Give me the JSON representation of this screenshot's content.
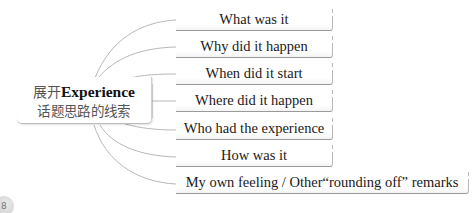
{
  "diagram": {
    "type": "mind-map",
    "center": {
      "line1_cn": "展开",
      "line1_en": "Experience",
      "line2": "话题思路的线索"
    },
    "branches": [
      {
        "label": "What was it"
      },
      {
        "label": "Why did it happen"
      },
      {
        "label": "When did it start"
      },
      {
        "label": "Where did it happen"
      },
      {
        "label": "Who had the experience"
      },
      {
        "label": "How was it"
      },
      {
        "label": "My own feeling / Other“rounding off” remarks"
      }
    ],
    "corner_badge": {
      "label": "8"
    },
    "colors": {
      "connector": "#b5b5b5",
      "box_border": "#9a9a9a",
      "text": "#1a1a1a",
      "center_text": "#555555"
    }
  }
}
